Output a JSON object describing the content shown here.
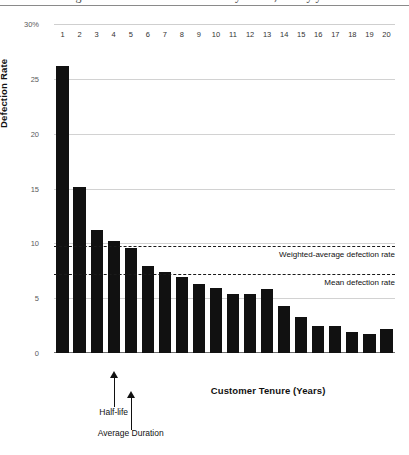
{
  "figure": {
    "caption_remnant": "figure 1  customer defection rates by tenure, twenty years",
    "y_axis_title": "Defection Rate",
    "x_axis_title": "Customer Tenure (Years)"
  },
  "chart_data": {
    "type": "bar",
    "title": "",
    "xlabel": "Customer Tenure (Years)",
    "ylabel": "Defection Rate",
    "categories": [
      "1",
      "2",
      "3",
      "4",
      "5",
      "6",
      "7",
      "8",
      "9",
      "10",
      "11",
      "12",
      "13",
      "14",
      "15",
      "16",
      "17",
      "18",
      "19",
      "20"
    ],
    "values": [
      26.2,
      15.1,
      11.2,
      10.2,
      9.6,
      7.9,
      7.4,
      6.9,
      6.3,
      5.9,
      5.4,
      5.4,
      5.8,
      4.3,
      3.3,
      2.5,
      2.5,
      1.9,
      1.7,
      2.2
    ],
    "series": [
      {
        "name": "Defection Rate",
        "values": [
          26.2,
          15.1,
          11.2,
          10.2,
          9.6,
          7.9,
          7.4,
          6.9,
          6.3,
          5.9,
          5.4,
          5.4,
          5.8,
          4.3,
          3.3,
          2.5,
          2.5,
          1.9,
          1.7,
          2.2
        ]
      }
    ],
    "ylim": [
      0,
      30
    ],
    "yticks": [
      0,
      5,
      10,
      15,
      20,
      25,
      30
    ],
    "ytick_labels": [
      "0",
      "5",
      "10",
      "15",
      "20",
      "25",
      "30%"
    ],
    "grid": true,
    "legend": "none",
    "bar_color": "#111111",
    "gridline_color": "#d2d2d2",
    "reference_lines": [
      {
        "label": "Weighted-average defection rate",
        "value": 9.8,
        "style": "dashed"
      },
      {
        "label": "Mean defection rate",
        "value": 7.2,
        "style": "dashed"
      }
    ],
    "annotations": [
      {
        "label": "Half-life",
        "at_category": "4"
      },
      {
        "label": "Average Duration",
        "at_category": "5"
      }
    ]
  }
}
